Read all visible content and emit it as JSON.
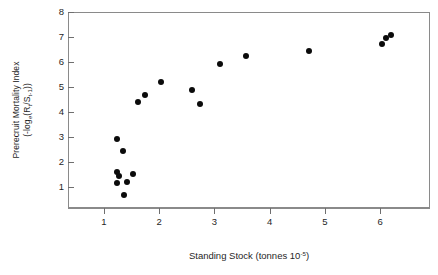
{
  "chart_data": {
    "type": "scatter",
    "title": "",
    "xlabel": "Standing Stock (tonnes 10-5)",
    "xlabel_parts": {
      "text": "Standing Stock (tonnes 10",
      "exponent": "-5",
      "tail": ")"
    },
    "ylabel_line1": "Prerecruit Mortality Index",
    "ylabel_line2": "(-loge(Rt/St-1))",
    "ylabel_parts": {
      "open": "(-log",
      "e": "e",
      "openparen": "(R",
      "t1": "t",
      "slash": "/S",
      "t2": "t-1",
      "close": "))"
    },
    "xlim": [
      0.35,
      6.9
    ],
    "ylim": [
      0.15,
      8.0
    ],
    "xticks": [
      1,
      2,
      3,
      4,
      5,
      6
    ],
    "yticks": [
      1,
      2,
      3,
      4,
      5,
      6,
      7,
      8
    ],
    "xtick_labels": [
      "1",
      "2",
      "3",
      "4",
      "5",
      "6"
    ],
    "ytick_labels": [
      "1",
      "2",
      "3",
      "4",
      "5",
      "6",
      "7",
      "8"
    ],
    "grid": false,
    "legend": null,
    "marker": {
      "shape": "circle",
      "color": "#0b0b0b",
      "size": 6
    },
    "points": [
      {
        "x": 1.22,
        "y": 2.94
      },
      {
        "x": 1.33,
        "y": 2.46
      },
      {
        "x": 1.22,
        "y": 1.62
      },
      {
        "x": 1.26,
        "y": 1.47
      },
      {
        "x": 1.21,
        "y": 1.2
      },
      {
        "x": 1.4,
        "y": 1.24
      },
      {
        "x": 1.5,
        "y": 1.57
      },
      {
        "x": 1.35,
        "y": 0.72
      },
      {
        "x": 1.6,
        "y": 4.42
      },
      {
        "x": 1.72,
        "y": 4.7
      },
      {
        "x": 2.02,
        "y": 5.25
      },
      {
        "x": 2.58,
        "y": 4.92
      },
      {
        "x": 2.72,
        "y": 4.35
      },
      {
        "x": 3.08,
        "y": 5.95
      },
      {
        "x": 3.55,
        "y": 6.26
      },
      {
        "x": 4.7,
        "y": 6.49
      },
      {
        "x": 6.02,
        "y": 6.76
      },
      {
        "x": 6.08,
        "y": 6.99
      },
      {
        "x": 6.18,
        "y": 7.13
      }
    ]
  }
}
